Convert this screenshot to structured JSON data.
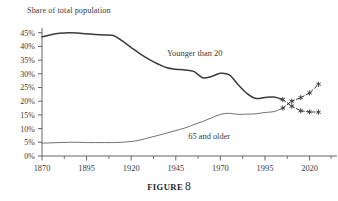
{
  "figure": {
    "caption_word": "FIGURE",
    "caption_number": "8"
  },
  "chart_data": {
    "type": "line",
    "title": "Share of total population",
    "xlabel": "",
    "ylabel": "Share of total population",
    "xlim": [
      1870,
      2032
    ],
    "ylim": [
      0,
      46
    ],
    "grid": false,
    "legend": "inline-annotations",
    "y_ticks": [
      "0%",
      "5%",
      "10%",
      "15%",
      "20%",
      "25%",
      "30%",
      "35%",
      "40%",
      "45%"
    ],
    "y_tick_values": [
      0,
      5,
      10,
      15,
      20,
      25,
      30,
      35,
      40,
      45
    ],
    "x_ticks": [
      "1870",
      "1895",
      "1920",
      "1945",
      "1970",
      "1995",
      "2020"
    ],
    "x_tick_values": [
      1870,
      1895,
      1920,
      1945,
      1970,
      1995,
      2020
    ],
    "x_minor_tick_values": [
      1882.5,
      1907.5,
      1932.5,
      1957.5,
      1982.5,
      2007.5,
      2032
    ],
    "annotations": [
      {
        "text": "Younger than 20",
        "x": 1940,
        "y": 36.5
      },
      {
        "text": "65 and older",
        "x": 1952,
        "y": 6.2
      }
    ],
    "series": [
      {
        "name": "Younger than 20",
        "style": "solid",
        "color": "#3b3b3b",
        "x": [
          1870,
          1875,
          1880,
          1885,
          1890,
          1895,
          1900,
          1905,
          1910,
          1915,
          1920,
          1925,
          1930,
          1935,
          1940,
          1945,
          1950,
          1955,
          1960,
          1965,
          1970,
          1975,
          1980,
          1985,
          1990,
          1995,
          2000,
          2005
        ],
        "values": [
          43.5,
          44.3,
          44.8,
          45.0,
          44.9,
          44.6,
          44.4,
          44.2,
          44.0,
          42.0,
          39.6,
          37.3,
          35.3,
          33.6,
          32.2,
          31.7,
          31.4,
          30.9,
          28.6,
          29.0,
          30.2,
          29.6,
          26.0,
          22.8,
          21.0,
          21.4,
          21.5,
          20.6
        ]
      },
      {
        "name": "Younger than 20 (projection)",
        "style": "dashed",
        "marker": "asterisk",
        "color": "#3b3b3b",
        "x": [
          2005,
          2010,
          2015,
          2020,
          2025
        ],
        "values": [
          20.6,
          18.2,
          16.5,
          16.1,
          16.0
        ]
      },
      {
        "name": "65 and older",
        "style": "solid",
        "color": "#6a6a6a",
        "x": [
          1870,
          1875,
          1880,
          1885,
          1890,
          1895,
          1900,
          1905,
          1910,
          1915,
          1920,
          1925,
          1930,
          1935,
          1940,
          1945,
          1950,
          1955,
          1960,
          1965,
          1970,
          1975,
          1980,
          1985,
          1990,
          1995,
          2000,
          2005
        ],
        "values": [
          4.7,
          4.8,
          4.9,
          5.0,
          5.0,
          4.9,
          4.9,
          4.9,
          4.9,
          5.0,
          5.3,
          5.8,
          6.7,
          7.5,
          8.4,
          9.3,
          10.2,
          11.4,
          12.6,
          13.9,
          15.2,
          15.6,
          15.2,
          15.3,
          15.4,
          15.9,
          16.2,
          17.5
        ]
      },
      {
        "name": "65 and older (projection)",
        "style": "dashed",
        "marker": "asterisk",
        "color": "#3b3b3b",
        "x": [
          2005,
          2010,
          2015,
          2020,
          2025
        ],
        "values": [
          17.5,
          20.0,
          21.3,
          23.0,
          26.2
        ]
      }
    ]
  }
}
